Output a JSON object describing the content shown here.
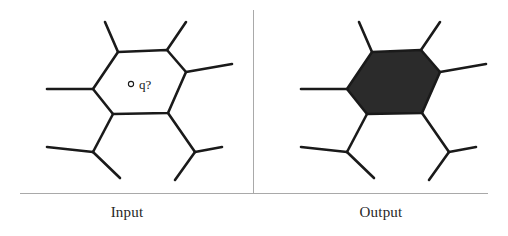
{
  "figure": {
    "title": "",
    "panels": [
      {
        "id": "input",
        "caption": "Input",
        "point_label": "q?",
        "cell_filled": false,
        "fill_color": "#ffffff",
        "stroke_color": "#1a1a1a"
      },
      {
        "id": "output",
        "caption": "Output",
        "point_label": "",
        "cell_filled": true,
        "fill_color": "#2b2b2b",
        "stroke_color": "#1a1a1a"
      }
    ],
    "divider_color": "#a9a9a9",
    "background_color": "#ffffff"
  },
  "geometry": {
    "hexagon": "118,52 167,50 186,72 168,113 113,114 93,89",
    "stubs": [
      "118,52 105,22",
      "167,50 186,22",
      "186,72 232,64",
      "93,89 47,89",
      "113,114 93,152",
      "168,113 195,152",
      "93,152 47,147",
      "93,152 120,178",
      "195,152 222,147",
      "195,152 175,180"
    ],
    "query_point": {
      "cx": 131,
      "cy": 84,
      "r": 2.6
    },
    "query_text": {
      "x": 139,
      "y": 89
    }
  }
}
